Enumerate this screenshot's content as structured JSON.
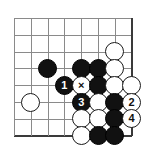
{
  "diagram": {
    "kind": "go-board-problem",
    "title": "",
    "board": {
      "columns": 8,
      "rows": 8,
      "origin_x": 14,
      "origin_y": 18,
      "spacing": 16.8,
      "edges": {
        "right_column": 7,
        "bottom_row": 7
      },
      "line_color": "#8a8a8a",
      "edge_color": "#3a3a3a",
      "background": "#ffffff"
    },
    "colors": {
      "black_stone": "#111111",
      "white_stone": "#ffffff",
      "stone_outline": "#1a1a1a",
      "black_label": "#ffffff",
      "white_label": "#111111"
    },
    "stones": [
      {
        "color": "black",
        "col": 2,
        "row": 3,
        "label": ""
      },
      {
        "color": "black",
        "col": 4,
        "row": 3,
        "label": ""
      },
      {
        "color": "black",
        "col": 5,
        "row": 3,
        "label": ""
      },
      {
        "color": "white",
        "col": 6,
        "row": 2,
        "label": ""
      },
      {
        "color": "white",
        "col": 6,
        "row": 3,
        "label": ""
      },
      {
        "color": "black",
        "col": 3,
        "row": 4,
        "label": "1"
      },
      {
        "color": "white",
        "col": 4,
        "row": 4,
        "label": "×"
      },
      {
        "color": "black",
        "col": 5,
        "row": 4,
        "label": ""
      },
      {
        "color": "white",
        "col": 6,
        "row": 4,
        "label": ""
      },
      {
        "color": "white",
        "col": 7,
        "row": 4,
        "label": ""
      },
      {
        "color": "white",
        "col": 1,
        "row": 5,
        "label": ""
      },
      {
        "color": "black",
        "col": 4,
        "row": 5,
        "label": "3"
      },
      {
        "color": "white",
        "col": 5,
        "row": 5,
        "label": ""
      },
      {
        "color": "black",
        "col": 6,
        "row": 5,
        "label": ""
      },
      {
        "color": "white",
        "col": 7,
        "row": 5,
        "label": "2"
      },
      {
        "color": "white",
        "col": 4,
        "row": 6,
        "label": ""
      },
      {
        "color": "white",
        "col": 5,
        "row": 6,
        "label": ""
      },
      {
        "color": "black",
        "col": 6,
        "row": 6,
        "label": ""
      },
      {
        "color": "white",
        "col": 7,
        "row": 6,
        "label": "4"
      },
      {
        "color": "white",
        "col": 4,
        "row": 7,
        "label": ""
      },
      {
        "color": "black",
        "col": 5,
        "row": 7,
        "label": ""
      },
      {
        "color": "black",
        "col": 6,
        "row": 7,
        "label": ""
      }
    ],
    "move_sequence": [
      {
        "number": "1",
        "color": "black"
      },
      {
        "number": "2",
        "color": "white"
      },
      {
        "number": "3",
        "color": "black"
      },
      {
        "number": "4",
        "color": "white"
      }
    ],
    "markers": [
      {
        "symbol": "×",
        "on_color": "white",
        "col": 4,
        "row": 4
      }
    ]
  }
}
